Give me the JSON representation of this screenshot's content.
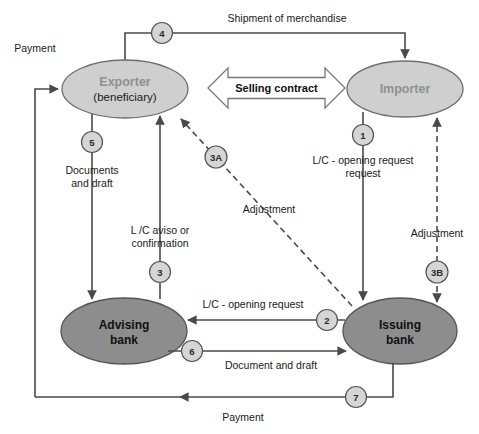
{
  "diagram": {
    "colors": {
      "party_fill": "#cfcfcf",
      "party_stroke": "#6e6e6e",
      "party_text": "#8f8f8f",
      "bank_fill": "#8d8d8d",
      "bank_stroke": "#555555",
      "bank_text": "#111111",
      "line": "#4a4a4a",
      "badge_fill": "#d5d5d5",
      "badge_stroke": "#555555",
      "contract_fill": "#ffffff",
      "contract_stroke": "#777777"
    },
    "nodes": [
      {
        "id": "exporter",
        "label": "Exporter",
        "sublabel": "(beneficiary)",
        "type": "party",
        "cx": 125,
        "cy": 89,
        "rx": 63,
        "ry": 29
      },
      {
        "id": "importer",
        "label": "Importer",
        "sublabel": "",
        "type": "party",
        "cx": 405,
        "cy": 89,
        "rx": 58,
        "ry": 28
      },
      {
        "id": "advising-bank",
        "label": "Advising",
        "sublabel": "bank",
        "type": "bank",
        "cx": 124,
        "cy": 331,
        "rx": 63,
        "ry": 33
      },
      {
        "id": "issuing-bank",
        "label": "Issuing",
        "sublabel": "bank",
        "type": "bank",
        "cx": 400,
        "cy": 331,
        "rx": 57,
        "ry": 33
      }
    ],
    "edges": [
      {
        "id": "shipment",
        "label": "Shipment of merchandise",
        "badge": "4",
        "from": "exporter",
        "to": "importer",
        "style": "solid"
      },
      {
        "id": "selling-contract",
        "label": "Selling contract",
        "badge": "",
        "from": "exporter",
        "to": "importer",
        "style": "block-arrow-double"
      },
      {
        "id": "lc-opening-request-importer",
        "label": "L/C - opening request",
        "badge": "1",
        "from": "importer",
        "to": "issuing-bank",
        "style": "solid"
      },
      {
        "id": "documents-and-draft",
        "label_line1": "Documents",
        "label_line2": "and draft",
        "badge": "5",
        "from": "exporter",
        "to": "advising-bank",
        "style": "solid"
      },
      {
        "id": "lc-aviso",
        "label_line1": "L /C aviso or",
        "label_line2": "confirmation",
        "badge": "3",
        "from": "advising-bank",
        "to": "exporter",
        "style": "solid"
      },
      {
        "id": "adjustment-a",
        "label": "Adjustment",
        "badge": "3A",
        "from": "issuing-bank",
        "to": "exporter",
        "style": "dashed"
      },
      {
        "id": "adjustment-b",
        "label": "Adjustment",
        "badge": "3B",
        "from": "issuing-bank",
        "to": "importer",
        "style": "dashed-double"
      },
      {
        "id": "lc-opening-request-bank",
        "label": "L/C - opening request",
        "badge": "2",
        "from": "issuing-bank",
        "to": "advising-bank",
        "style": "solid"
      },
      {
        "id": "document-and-draft",
        "label": "Document and draft",
        "badge": "6",
        "from": "advising-bank",
        "to": "issuing-bank",
        "style": "solid"
      },
      {
        "id": "payment-bottom",
        "label": "Payment",
        "badge": "7",
        "from": "issuing-bank",
        "to": "advising-bank",
        "style": "solid"
      },
      {
        "id": "payment-left",
        "label": "Payment",
        "badge": "",
        "from": "payment-bottom",
        "to": "exporter",
        "style": "solid"
      }
    ]
  }
}
